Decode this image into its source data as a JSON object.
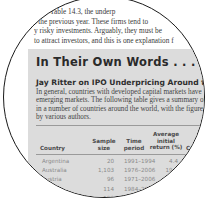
{
  "body_text": {
    "lines": [
      "ed in Table 14.3, the underp",
      "f the previous year. These firms tend to",
      "y risky investments. Arguably, they must be",
      "to attract investors, and this is one explanation f"
    ]
  },
  "sidebar_box": {
    "title": "In Their Own Words . . .",
    "subtitle": "Jay Ritter on IPO Underpricing Around the World",
    "paragraph_lines": [
      "In general, countries with developed capital markets have",
      "emerging markets. The following table gives a summary of",
      "in a number of countries around the world, with the figure",
      "by various authors."
    ],
    "table": {
      "headers": {
        "country": "Country",
        "sample_size": [
          "Sample",
          "size"
        ],
        "time_period": [
          "Time",
          "period"
        ],
        "avg_return": [
          "Average",
          "initial",
          "return (%)"
        ],
        "country2": "Country"
      },
      "rows": [
        {
          "country": "Argentina",
          "sample_size": "20",
          "time_period": "1991–1994",
          "avg_return": "4.4",
          "country2": "Japan"
        },
        {
          "country": "Australia",
          "sample_size": "1,103",
          "time_period": "1976–2006",
          "avg_return": "19.8",
          "country2": "Korea"
        },
        {
          "country": "Austria",
          "sample_size": "96",
          "time_period": "1971–2006",
          "avg_return": "6.5",
          "country2": ""
        },
        {
          "country": "",
          "sample_size": "114",
          "time_period": "1984–2006",
          "avg_return": "13.5",
          "country2": ""
        },
        {
          "country": "",
          "sample_size": "180",
          "time_period": "1979–2006",
          "avg_return": "",
          "country2": ""
        }
      ]
    }
  }
}
